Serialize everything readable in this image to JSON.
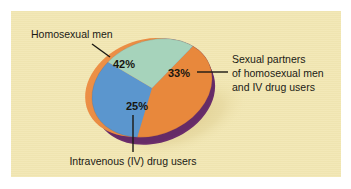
{
  "figure": {
    "background_color": "#f2e7b4",
    "outer_margin_color": "#ffffff"
  },
  "chart_data": {
    "type": "pie",
    "title": "",
    "subtitle": "",
    "xlabel": "",
    "ylabel": "",
    "legend_position": "callout-labels",
    "style": "3d-tilted-pie",
    "categories": [
      "Homosexual men",
      "Sexual partners of homosexual men and IV drug users",
      "Intravenous (IV) drug users"
    ],
    "values": [
      42,
      33,
      25
    ],
    "value_labels": [
      "42%",
      "33%",
      "25%"
    ],
    "colors": [
      "#e8883c",
      "#5b96ce",
      "#a6d3bb"
    ],
    "side_wall_color": "#6b2d6b",
    "shadow_color": "#e0cf92",
    "slices": [
      {
        "name": "homosexual-men",
        "label": "Homosexual men",
        "percent_label": "42%",
        "value": 42,
        "color": "#e8883c"
      },
      {
        "name": "sexual-partners",
        "label": "Sexual partners of homosexual men and IV drug users",
        "label_lines": [
          "Sexual partners",
          "of homosexual men",
          "and IV drug users"
        ],
        "percent_label": "33%",
        "value": 33,
        "color": "#5b96ce"
      },
      {
        "name": "iv-drug-users",
        "label": "Intravenous (IV) drug users",
        "percent_label": "25%",
        "value": 25,
        "color": "#a6d3bb"
      }
    ]
  },
  "callouts": {
    "top_left": "Homosexual men",
    "right_line1": "Sexual partners",
    "right_line2": "of homosexual men",
    "right_line3": "and IV drug users",
    "bottom": "Intravenous (IV) drug users"
  }
}
